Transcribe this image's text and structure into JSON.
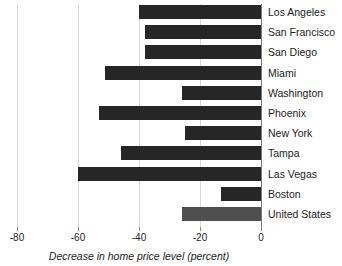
{
  "chart_data": {
    "type": "bar",
    "orientation": "horizontal",
    "title": "",
    "xlabel": "Decrease in home price level (percent)",
    "ylabel": "",
    "xlim": [
      -80,
      0
    ],
    "xticks": [
      -80,
      -60,
      -40,
      -20,
      0
    ],
    "xtick_labels": [
      "-80",
      "-60",
      "-40",
      "-20",
      "0"
    ],
    "grid": true,
    "grid_axis": "x",
    "legend": "none",
    "categories": [
      "Los Angeles",
      "San Francisco",
      "San Diego",
      "Miami",
      "Washington",
      "Phoenix",
      "New York",
      "Tampa",
      "Las Vegas",
      "Boston",
      "United States"
    ],
    "values": [
      -40,
      -38,
      -38,
      -51,
      -26,
      -53,
      -25,
      -46,
      -60,
      -13,
      -26
    ],
    "bar_colors": [
      "#262626",
      "#262626",
      "#262626",
      "#262626",
      "#262626",
      "#262626",
      "#262626",
      "#262626",
      "#262626",
      "#262626",
      "#4f4f4f"
    ],
    "highlight_category": "United States",
    "colors": {
      "bar": "#262626",
      "bar_highlight": "#4f4f4f",
      "gridline": "#d8d8d8",
      "axis": "#7a7a7a",
      "text": "#1c1c1c",
      "background": "#ffffff"
    }
  }
}
